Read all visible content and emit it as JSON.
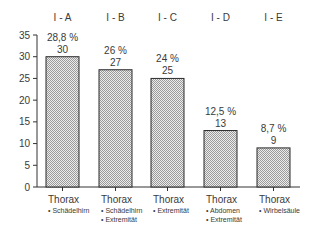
{
  "chart_data": {
    "type": "bar",
    "title": "",
    "xlabel": "",
    "ylabel": "",
    "ylim": [
      0,
      35
    ],
    "yticks": [
      0,
      5,
      10,
      15,
      20,
      25,
      30,
      35
    ],
    "grid": false,
    "legend": null,
    "groups": [
      "I-A",
      "I-B",
      "I-C",
      "I-D",
      "I-E"
    ],
    "categories": [
      "I-A",
      "I-B",
      "I-C",
      "I-D",
      "I-E"
    ],
    "values": [
      30,
      27,
      25,
      13,
      9
    ],
    "percentages": [
      "28,8 %",
      "26 %",
      "24 %",
      "12,5 %",
      "8,7 %"
    ],
    "category_labels": [
      {
        "main": "Thorax",
        "sub": [
          "• Schädelhirn"
        ]
      },
      {
        "main": "Thorax",
        "sub": [
          "• Schädelhirn",
          "• Extremität"
        ]
      },
      {
        "main": "Thorax",
        "sub": [
          "• Extremität"
        ]
      },
      {
        "main": "Thorax",
        "sub": [
          "• Abdomen",
          "• Extremität"
        ]
      },
      {
        "main": "Thorax",
        "sub": [
          "• Wirbelsäule"
        ]
      }
    ],
    "bar_fill": "#d4d4d4",
    "bar_stroke": "#2a2a2a"
  }
}
